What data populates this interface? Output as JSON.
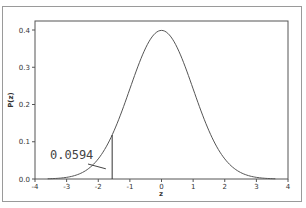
{
  "chart_data": {
    "type": "line",
    "title": "",
    "xlabel": "z",
    "ylabel": "P(z)",
    "xlim": [
      -4,
      4
    ],
    "ylim": [
      0.0,
      0.42
    ],
    "grid": false,
    "x_ticks": [
      "-4",
      "-3",
      "-2",
      "-1",
      "0",
      "1",
      "2",
      "3",
      "4"
    ],
    "y_ticks": [
      "0.0",
      "0.1",
      "0.2",
      "0.3",
      "0.4"
    ],
    "series": [
      {
        "name": "Standard normal density",
        "x": [
          -4,
          -3.5,
          -3,
          -2.5,
          -2,
          -1.5,
          -1,
          -0.5,
          0,
          0.5,
          1,
          1.5,
          2,
          2.5,
          3,
          3.5,
          4
        ],
        "values": [
          0.0001,
          0.0009,
          0.0044,
          0.0175,
          0.054,
          0.1295,
          0.242,
          0.3521,
          0.3989,
          0.3521,
          0.242,
          0.1295,
          0.054,
          0.0175,
          0.0044,
          0.0009,
          0.0001
        ]
      }
    ],
    "annotations": [
      {
        "text": "0.0594",
        "type": "tail-area-label",
        "pointer_to_z": -1.95
      },
      {
        "type": "vertical-line",
        "z": -1.56
      }
    ]
  },
  "labels": {
    "xlabel": "z",
    "ylabel": "P(z)",
    "annotation": "0.0594"
  }
}
